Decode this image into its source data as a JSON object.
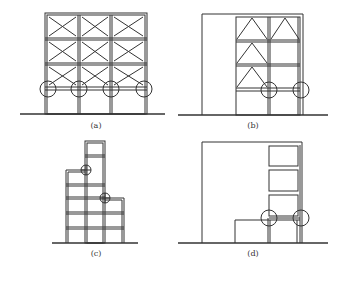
{
  "figure": {
    "panels": [
      {
        "id": "a",
        "caption": "(a)",
        "description": "Four-storey frame fully X-braced in upper three storeys, soft open ground storey; circles mark the four column-beam joints above the ground storey"
      },
      {
        "id": "b",
        "caption": "(b)",
        "description": "Tall outer frame with inner two-bay frame; chevron bracing in left bays (three storeys) and one right bay (top); circles mark two joints above ground storey"
      },
      {
        "id": "c",
        "caption": "(c)",
        "description": "Stepped elevation with a narrow tower on top of a setback; circles mark re-entrant corners at setbacks"
      },
      {
        "id": "d",
        "caption": "(d)",
        "description": "Large outer frame with stacked infill panels at right and a low annex; circles mark joints above the ground storey"
      }
    ],
    "colors": {
      "line": "#333333",
      "background": "#ffffff"
    }
  }
}
